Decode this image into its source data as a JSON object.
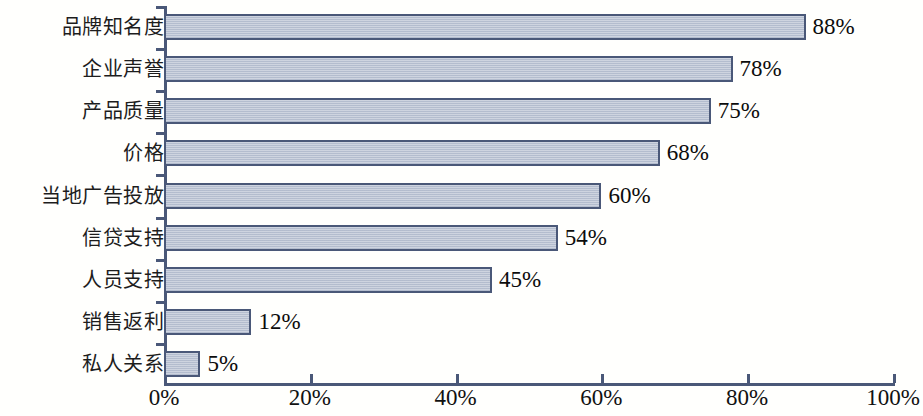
{
  "chart_data": {
    "type": "bar",
    "orientation": "horizontal",
    "title": "",
    "subtitle": "",
    "xlabel": "",
    "ylabel": "",
    "xlim": [
      0,
      100
    ],
    "grid": false,
    "legend": null,
    "value_label_suffix": "%",
    "categories": [
      "品牌知名度",
      "企业声誉",
      "产品质量",
      "价格",
      "当地广告投放",
      "信贷支持",
      "人员支持",
      "销售返利",
      "私人关系"
    ],
    "values": [
      88,
      78,
      75,
      68,
      60,
      54,
      45,
      12,
      5
    ],
    "value_labels": [
      "88%",
      "78%",
      "75%",
      "68%",
      "60%",
      "54%",
      "45%",
      "12%",
      "5%"
    ],
    "x_ticks": [
      0,
      20,
      40,
      60,
      80,
      100
    ],
    "x_tick_labels": [
      "0%",
      "20%",
      "40%",
      "60%",
      "80%",
      "100%"
    ],
    "colors": {
      "bar_fill": "#b9c2d2",
      "bar_border": "#4a5878",
      "axis": "#4a5878",
      "background": "#fffffd",
      "category_text": "#1d1d1d",
      "value_text": "#0c0c0c",
      "tick_text": "#111111"
    }
  }
}
